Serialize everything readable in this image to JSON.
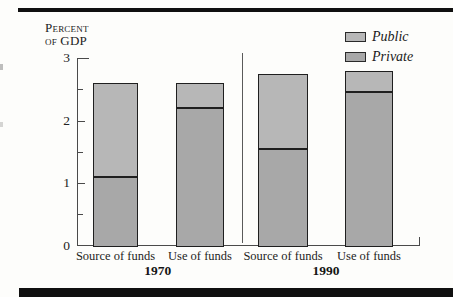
{
  "figure": {
    "y_axis_title": [
      "Percent",
      "of GDP"
    ]
  },
  "chart_data": {
    "type": "bar",
    "stacked": true,
    "title": "",
    "ylabel": "Percent of GDP",
    "ylim": [
      0,
      3
    ],
    "yticks": [
      0,
      1,
      2,
      3
    ],
    "yticks_minor": [
      0.5,
      1.5,
      2.5
    ],
    "legend_position": "top-right",
    "legend": [
      {
        "label": "Public",
        "color": "#b7b7b7"
      },
      {
        "label": "Private",
        "color": "#a8a8a8"
      }
    ],
    "bar_border_color": "#1f1f1f",
    "groups": [
      {
        "year": "1970",
        "bars": [
          {
            "label": "Source of funds",
            "private": 1.1,
            "public": 1.5,
            "total": 2.6
          },
          {
            "label": "Use of funds",
            "private": 2.2,
            "public": 0.4,
            "total": 2.6
          }
        ]
      },
      {
        "year": "1990",
        "bars": [
          {
            "label": "Source of funds",
            "private": 1.55,
            "public": 1.2,
            "total": 2.75
          },
          {
            "label": "Use of funds",
            "private": 2.45,
            "public": 0.35,
            "total": 2.8
          }
        ]
      }
    ]
  }
}
